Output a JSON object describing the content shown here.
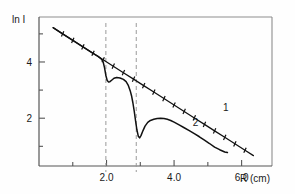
{
  "chart_data": {
    "type": "line",
    "title": "",
    "xlabel": "R (cm)",
    "ylabel": "ln I",
    "xlim": [
      0.0,
      6.9
    ],
    "ylim": [
      0.3,
      5.6
    ],
    "grid": false,
    "legend_position": "inline-annotation",
    "xticks": [
      1.0,
      2.0,
      3.0,
      4.0,
      5.0,
      6.0
    ],
    "xtick_labels": [
      "",
      "2.0",
      "",
      "4.0",
      "",
      "6.0"
    ],
    "yticks": [
      1,
      2,
      3,
      4,
      5
    ],
    "ytick_labels": [
      "",
      "2",
      "",
      "4",
      ""
    ],
    "annotations": [
      {
        "text": "1",
        "x": 5.45,
        "y": 2.25,
        "series": "1"
      },
      {
        "text": "2",
        "x": 4.55,
        "y": 1.72,
        "series": "2"
      }
    ],
    "reference_lines": [
      {
        "orientation": "vertical",
        "x": 1.98,
        "style": "dashed",
        "color": "#9a9a9a"
      },
      {
        "orientation": "vertical",
        "x": 2.88,
        "style": "dashed",
        "color": "#9a9a9a"
      }
    ],
    "series": [
      {
        "name": "1",
        "label": "1",
        "style": "solid-with-markers",
        "color": "#111111",
        "description": "straight reference decay line with tick data markers",
        "x": [
          0.42,
          0.7,
          1.0,
          1.3,
          1.6,
          1.9,
          2.2,
          2.5,
          2.8,
          3.1,
          3.4,
          3.7,
          4.0,
          4.3,
          4.6,
          4.9,
          5.2,
          5.5,
          5.8,
          6.1,
          6.35
        ],
        "y": [
          5.22,
          5.0,
          4.77,
          4.54,
          4.31,
          4.08,
          3.85,
          3.62,
          3.39,
          3.16,
          2.93,
          2.7,
          2.47,
          2.24,
          2.01,
          1.78,
          1.55,
          1.32,
          1.09,
          0.86,
          0.67
        ]
      },
      {
        "name": "2",
        "label": "2",
        "style": "solid",
        "color": "#111111",
        "description": "measured curve with two absorption dips at R = 1.98 cm and R = 2.88 cm",
        "x": [
          0.42,
          0.7,
          1.0,
          1.3,
          1.6,
          1.75,
          1.85,
          1.9,
          1.94,
          1.98,
          2.02,
          2.06,
          2.1,
          2.16,
          2.22,
          2.3,
          2.4,
          2.5,
          2.58,
          2.64,
          2.7,
          2.74,
          2.78,
          2.82,
          2.86,
          2.9,
          2.94,
          2.98,
          3.02,
          3.08,
          3.14,
          3.22,
          3.3,
          3.4,
          3.5,
          3.6,
          3.7,
          3.8,
          3.9,
          4.0,
          4.15,
          4.3,
          4.45,
          4.6,
          4.75,
          4.9,
          5.05,
          5.2,
          5.35,
          5.5,
          5.58
        ],
        "y": [
          5.22,
          5.0,
          4.77,
          4.54,
          4.31,
          4.2,
          4.1,
          4.0,
          3.8,
          3.52,
          3.34,
          3.29,
          3.3,
          3.36,
          3.42,
          3.45,
          3.43,
          3.38,
          3.3,
          3.18,
          2.98,
          2.8,
          2.55,
          2.25,
          1.9,
          1.58,
          1.36,
          1.3,
          1.38,
          1.56,
          1.72,
          1.85,
          1.92,
          1.96,
          1.99,
          2.0,
          1.99,
          1.96,
          1.92,
          1.86,
          1.76,
          1.66,
          1.56,
          1.45,
          1.34,
          1.22,
          1.1,
          0.97,
          0.88,
          0.8,
          0.78
        ]
      }
    ]
  },
  "axes": {
    "y_axis_label": "ln I",
    "x_axis_label": "R (cm)"
  },
  "colors": {
    "frame": "#8d8d8d",
    "curve": "#111111",
    "dashed_guide": "#9a9a9a",
    "background": "#fefefe",
    "text": "#1a1a1a"
  }
}
